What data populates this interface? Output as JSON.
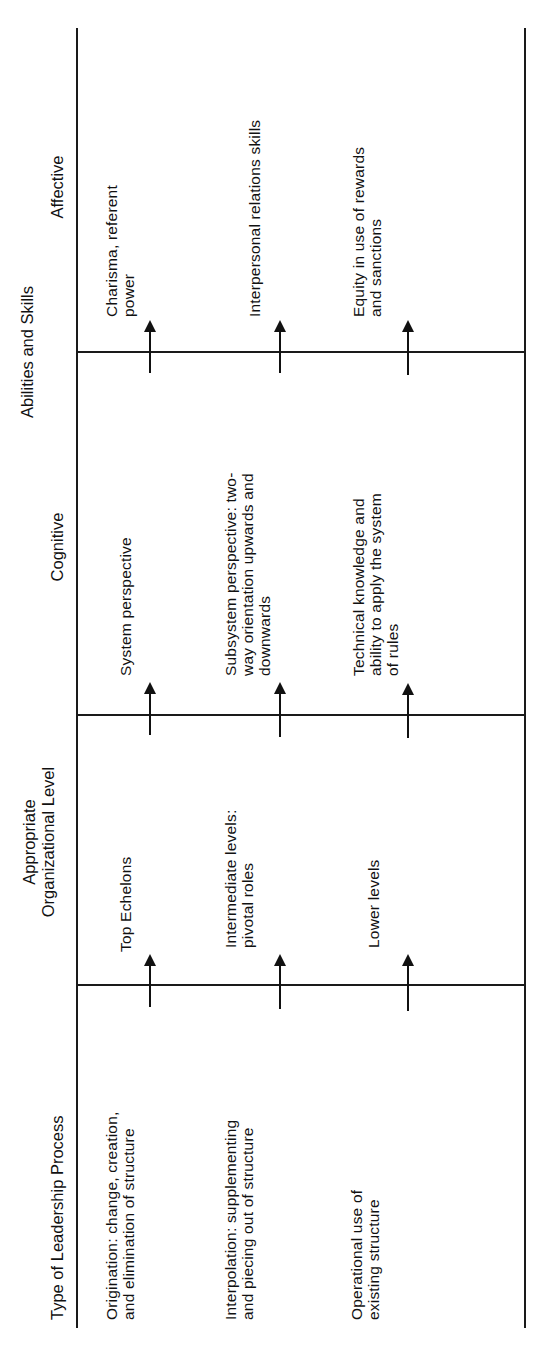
{
  "table": {
    "orientation": "rotated 90 degrees counter-clockwise",
    "headers": {
      "col1": "Type of Leadership Process",
      "col2": "Appropriate\nOrganizational Level",
      "group": "Abilities and Skills",
      "col3": "Cognitive",
      "col4": "Affective"
    },
    "rows": [
      {
        "process": "Origination: change, creation,\nand elimination of structure",
        "level": "Top Echelons",
        "cognitive": "System perspective",
        "affective": "Charisma, referent\npower"
      },
      {
        "process": "Interpolation:  supplementing\nand piecing out of structure",
        "level": "Intermediate levels:\npivotal roles",
        "cognitive": "Subsystem perspective: two-\nway orientation upwards and\ndownwards",
        "affective": "Interpersonal relations skills"
      },
      {
        "process": "Operational use of\nexisting structure",
        "level": "Lower levels",
        "cognitive": "Technical knowledge and\nability to apply the system\nof rules",
        "affective": "Equity in use of rewards\nand sanctions"
      }
    ],
    "arrow_icon": "right-arrow (reads upward on page)"
  }
}
